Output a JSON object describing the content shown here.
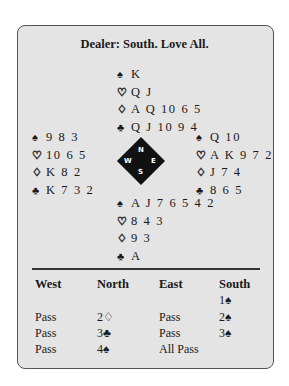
{
  "title": "Dealer: South. Love All.",
  "suits": {
    "spade": "♠",
    "heart": "♡",
    "diamond": "♢",
    "club": "♣"
  },
  "hands": {
    "north": {
      "spades": "K",
      "hearts": "Q J",
      "diamonds": "A Q 10 6 5",
      "clubs": "Q J 10 9 4"
    },
    "west": {
      "spades": "9 8 3",
      "hearts": "10 6 5",
      "diamonds": "K 8 2",
      "clubs": "K 7 3 2"
    },
    "east": {
      "spades": "Q 10",
      "hearts": "A K 9 7 2",
      "diamonds": "J 7 4",
      "clubs": "8 6 5"
    },
    "south": {
      "spades": "A J 7 6 5 4 2",
      "hearts": "8 4 3",
      "diamonds": "9 3",
      "clubs": "A"
    }
  },
  "compass": {
    "n": "N",
    "e": "E",
    "s": "S",
    "w": "W"
  },
  "auction": {
    "headers": [
      "West",
      "North",
      "East",
      "South"
    ],
    "rows": [
      [
        "",
        "",
        "",
        "1♠"
      ],
      [
        "Pass",
        "2♢",
        "Pass",
        "2♠"
      ],
      [
        "Pass",
        "3♣",
        "Pass",
        "3♠"
      ],
      [
        "Pass",
        "4♠",
        "All Pass",
        ""
      ]
    ]
  }
}
